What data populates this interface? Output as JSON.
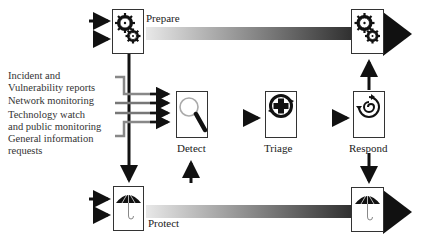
{
  "diagram": {
    "type": "incident-management-process-flow",
    "stages": {
      "prepare": {
        "label": "Prepare",
        "icon": "gears-icon"
      },
      "protect": {
        "label": "Protect",
        "icon": "umbrella-icon"
      },
      "detect": {
        "label": "Detect",
        "icon": "magnifier-icon"
      },
      "triage": {
        "label": "Triage",
        "icon": "medical-cross-icon"
      },
      "respond": {
        "label": "Respond",
        "icon": "cycle-arrows-icon"
      }
    },
    "inputs": [
      {
        "line1": "Incident and",
        "line2": "Vulnerability reports"
      },
      {
        "line1": "Network monitoring"
      },
      {
        "line1": "Technology watch",
        "line2": "and public monitoring"
      },
      {
        "line1": "General information",
        "line2": "requests"
      }
    ],
    "flows": [
      {
        "from": "external",
        "to": "prepare"
      },
      {
        "from": "prepare",
        "to": "prepare-end",
        "style": "gradient-bar"
      },
      {
        "from": "prepare",
        "to": "protect"
      },
      {
        "from": "inputs",
        "to": "detect"
      },
      {
        "from": "protect",
        "to": "detect"
      },
      {
        "from": "detect",
        "to": "triage"
      },
      {
        "from": "triage",
        "to": "respond"
      },
      {
        "from": "respond",
        "to": "prepare-end"
      },
      {
        "from": "respond",
        "to": "protect-end"
      },
      {
        "from": "external",
        "to": "protect"
      },
      {
        "from": "protect",
        "to": "protect-end",
        "style": "gradient-bar"
      }
    ],
    "colors": {
      "arrow": "#111111",
      "bar_start": "#e8e8e8",
      "bar_end": "#1a1a1a",
      "box_border": "#333333"
    }
  }
}
